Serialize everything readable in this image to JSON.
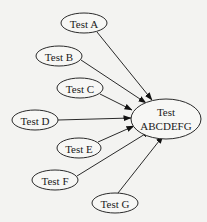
{
  "diagram": {
    "type": "directed-graph",
    "background": "#f3f3f1",
    "stroke_color": "#2a2a2a",
    "nodes": [
      {
        "id": "A",
        "label": "Test A",
        "cx": 84,
        "cy": 23,
        "rx": 23,
        "ry": 10
      },
      {
        "id": "B",
        "label": "Test B",
        "cx": 59,
        "cy": 56,
        "rx": 23,
        "ry": 10
      },
      {
        "id": "C",
        "label": "Test C",
        "cx": 80,
        "cy": 88,
        "rx": 23,
        "ry": 10
      },
      {
        "id": "D",
        "label": "Test D",
        "cx": 35,
        "cy": 120,
        "rx": 23,
        "ry": 10
      },
      {
        "id": "E",
        "label": "Test E",
        "cx": 79,
        "cy": 148,
        "rx": 22,
        "ry": 10
      },
      {
        "id": "F",
        "label": "Test F",
        "cx": 55,
        "cy": 180,
        "rx": 23,
        "ry": 10
      },
      {
        "id": "G",
        "label": "Test G",
        "cx": 115,
        "cy": 203,
        "rx": 23,
        "ry": 10
      }
    ],
    "target": {
      "id": "T",
      "label_line1": "Test",
      "label_line2": "ABCDEFG",
      "cx": 166,
      "cy": 119,
      "rx": 35,
      "ry": 20
    },
    "edges": [
      {
        "from": "A",
        "to": "T",
        "x1": 97,
        "y1": 32,
        "x2": 152,
        "y2": 100
      },
      {
        "from": "B",
        "to": "T",
        "x1": 81,
        "y1": 60,
        "x2": 146,
        "y2": 103
      },
      {
        "from": "C",
        "to": "T",
        "x1": 100,
        "y1": 94,
        "x2": 132,
        "y2": 110
      },
      {
        "from": "D",
        "to": "T",
        "x1": 58,
        "y1": 120,
        "x2": 131,
        "y2": 118
      },
      {
        "from": "E",
        "to": "T",
        "x1": 98,
        "y1": 142,
        "x2": 134,
        "y2": 126
      },
      {
        "from": "F",
        "to": "T",
        "x1": 77,
        "y1": 176,
        "x2": 150,
        "y2": 131
      },
      {
        "from": "G",
        "to": "T",
        "x1": 118,
        "y1": 193,
        "x2": 163,
        "y2": 136
      }
    ]
  }
}
